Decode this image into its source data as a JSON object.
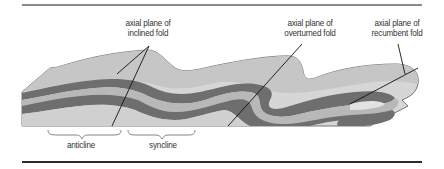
{
  "diagram": {
    "labels": {
      "inclined": [
        "axial plane of",
        "inclined fold"
      ],
      "overturned": [
        "axial plane of",
        "overturned fold"
      ],
      "recumbent": [
        "axial plane of",
        "recumbent fold"
      ],
      "anticline": "anticline",
      "syncline": "syncline"
    },
    "colors": {
      "light_layer": "#d6d6d6",
      "mid_layer": "#b8b8b8",
      "dark_layer": "#6e6e6e",
      "surface_top": "#c4c4c4",
      "outline": "#555555",
      "axial_line": "#111111",
      "top_rule": "#8a8a8a",
      "bottom_rule": "#2a2a2a"
    }
  }
}
